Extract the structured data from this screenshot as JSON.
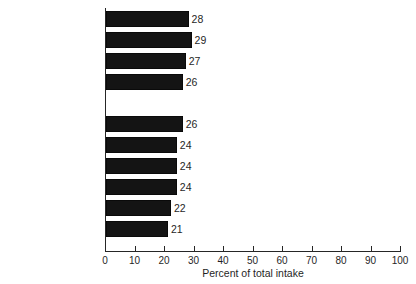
{
  "chart_data": {
    "type": "bar",
    "orientation": "horizontal",
    "title": "",
    "xlabel": "Percent of total intake",
    "ylabel": "",
    "xlim": [
      0,
      100
    ],
    "xticks": [
      0,
      10,
      20,
      30,
      40,
      50,
      60,
      70,
      80,
      90,
      100
    ],
    "grid": false,
    "legend": null,
    "categories": [
      "Food energy (Kcal)",
      "Total fat (g)",
      "Carbohydrate (g)",
      "Protein (g)",
      "Zinc (mg)",
      "Thiamin (mg)",
      "Iron (mg)",
      "Calcium (mg)",
      "Vitamin A (RE)",
      "Ascorbic acid (mg)"
    ],
    "values": [
      28,
      29,
      27,
      26,
      26,
      24,
      24,
      24,
      22,
      21
    ],
    "data_labels": [
      "28",
      "29",
      "27",
      "26",
      "26",
      "24",
      "24",
      "24",
      "22",
      "21"
    ],
    "group_break_after_index": 3,
    "bars": [
      {
        "label": "Food energy (Kcal)",
        "value": 28,
        "data_label": "28",
        "group": 1
      },
      {
        "label": "Total fat (g)",
        "value": 29,
        "data_label": "29",
        "group": 1
      },
      {
        "label": "Carbohydrate (g)",
        "value": 27,
        "data_label": "27",
        "group": 1
      },
      {
        "label": "Protein (g)",
        "value": 26,
        "data_label": "26",
        "group": 1
      },
      {
        "label": "Zinc (mg)",
        "value": 26,
        "data_label": "26",
        "group": 2
      },
      {
        "label": "Thiamin (mg)",
        "value": 24,
        "data_label": "24",
        "group": 2
      },
      {
        "label": "Iron (mg)",
        "value": 24,
        "data_label": "24",
        "group": 2
      },
      {
        "label": "Calcium (mg)",
        "value": 24,
        "data_label": "24",
        "group": 2
      },
      {
        "label": "Vitamin A (RE)",
        "value": 22,
        "data_label": "22",
        "group": 2
      },
      {
        "label": "Ascorbic acid (mg)",
        "value": 21,
        "data_label": "21",
        "group": 2
      }
    ]
  },
  "style": {
    "bar_color": "#141414",
    "axis_color": "#262626",
    "text_color": "#1f1f1f",
    "background": "#ffffff"
  }
}
